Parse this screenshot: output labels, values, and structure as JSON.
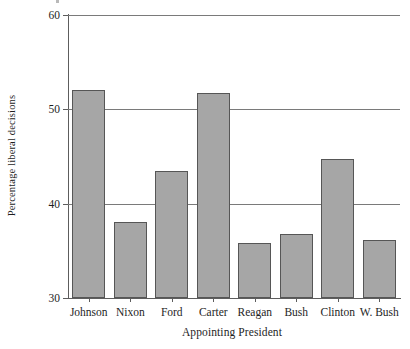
{
  "chart_data": {
    "type": "bar",
    "title": "",
    "xlabel": "Appointing President",
    "ylabel": "Percentage liberal decisions",
    "categories": [
      "Johnson",
      "Nixon",
      "Ford",
      "Carter",
      "Reagan",
      "Bush",
      "Clinton",
      "W. Bush"
    ],
    "values": [
      52.1,
      38.1,
      43.5,
      51.7,
      35.8,
      36.8,
      44.7,
      36.2
    ],
    "ylim": [
      30,
      60
    ],
    "yticks": [
      30,
      40,
      50,
      60
    ],
    "ytick_labels": [
      "30",
      "40",
      "50",
      "60"
    ],
    "grid": true,
    "grid_axis": "y",
    "legend": "none",
    "bar_fill": "#a6a6a6",
    "bar_edge": "#565656",
    "axis_color": "#5d5d5d"
  }
}
